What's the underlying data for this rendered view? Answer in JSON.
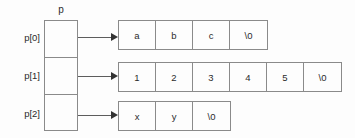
{
  "diagram": {
    "title_caption": "p",
    "pointer_array": {
      "name": "p",
      "cells": [
        {
          "label": "p[0]",
          "value": ""
        },
        {
          "label": "p[1]",
          "value": ""
        },
        {
          "label": "p[2]",
          "value": ""
        }
      ]
    },
    "strings": [
      {
        "from": "p[0]",
        "cells": [
          "a",
          "b",
          "c",
          "\\0"
        ]
      },
      {
        "from": "p[1]",
        "cells": [
          "1",
          "2",
          "3",
          "4",
          "5",
          "\\0"
        ]
      },
      {
        "from": "p[2]",
        "cells": [
          "x",
          "y",
          "\\0"
        ]
      }
    ],
    "arrows": [
      {
        "name": "arrow-p0",
        "from": "p[0]",
        "to": "string-row-0"
      },
      {
        "name": "arrow-p1",
        "from": "p[1]",
        "to": "string-row-1"
      },
      {
        "name": "arrow-p2",
        "from": "p[2]",
        "to": "string-row-2"
      }
    ],
    "colors": {
      "background": "#fdfdfd",
      "border": "#8a8a8a",
      "text": "#2b2b2b",
      "arrow": "#5d5d5d",
      "arrowhead": "#333333"
    }
  }
}
